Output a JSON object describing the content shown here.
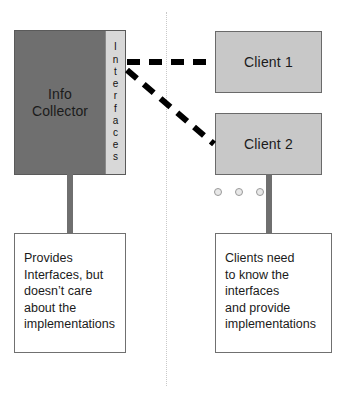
{
  "diagram": {
    "colors": {
      "provider_fill": "#6f6f6f",
      "interfaces_strip_fill": "#d8d8d8",
      "client_fill": "#c8c8c8",
      "note_fill": "#ffffff",
      "connector": "#6f6f6f",
      "relation_line": "#000000",
      "divider": "#c9c9c9",
      "dot_ring": "#9a9a9a"
    }
  },
  "provider": {
    "name_lines": [
      "Info",
      "Collector"
    ],
    "interfaces_label": "Interfaces",
    "interfaces_letters": [
      "I",
      "n",
      "t",
      "e",
      "r",
      "f",
      "a",
      "c",
      "e",
      "s"
    ]
  },
  "clients": [
    {
      "label": "Client 1"
    },
    {
      "label": "Client 2"
    }
  ],
  "ellipsis": {
    "label": "more clients",
    "dot_count": 3
  },
  "notes": {
    "left": {
      "lines": [
        "Provides",
        "Interfaces, but",
        "doesn’t care",
        "about the",
        "implementations"
      ]
    },
    "right": {
      "lines": [
        "Clients need",
        "to know the",
        "interfaces",
        "and provide",
        "implementations"
      ]
    }
  },
  "relations": [
    {
      "from": "interfaces",
      "to": "client-1",
      "style": "dashed"
    },
    {
      "from": "interfaces",
      "to": "client-2",
      "style": "dashed"
    }
  ]
}
